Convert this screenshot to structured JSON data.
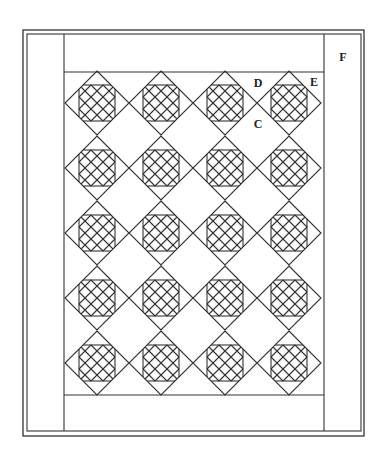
{
  "diagram": {
    "type": "quilt-layout",
    "colors": {
      "line": "#333333",
      "background": "#ffffff",
      "label": "#222222"
    },
    "frame": {
      "outer": {
        "x": 23,
        "y": 30,
        "w": 341,
        "h": 406
      },
      "inner": {
        "x": 27,
        "y": 34,
        "w": 334,
        "h": 397
      }
    },
    "strips": {
      "left_vertical_x": 64,
      "right_vertical_x": 324,
      "top_horizontal_y": 72,
      "bottom_horizontal_y": 395
    },
    "blocks": {
      "columns_x": [
        97,
        161,
        225,
        289
      ],
      "rows_y": [
        103,
        168,
        233,
        298,
        363
      ],
      "half_size": 32,
      "cut_offset": 18,
      "grid_offsets": [
        -24,
        -12,
        0,
        12,
        24
      ]
    },
    "labels": [
      {
        "id": "D",
        "text": "D",
        "x": 258,
        "y": 87
      },
      {
        "id": "E",
        "text": "E",
        "x": 314,
        "y": 86
      },
      {
        "id": "C",
        "text": "C",
        "x": 258,
        "y": 128
      },
      {
        "id": "F",
        "text": "F",
        "x": 343,
        "y": 61
      }
    ]
  }
}
